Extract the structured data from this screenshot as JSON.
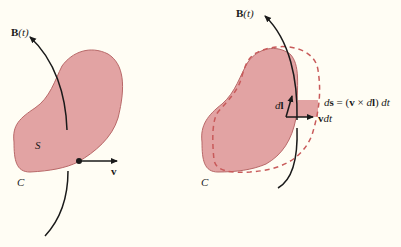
{
  "colors": {
    "background": "#fffdf4",
    "surface_fill": "#e2a3a3",
    "surface_stroke": "#b86868",
    "dashed_curve": "#c85a5a",
    "ink": "#1a1a1a"
  },
  "left_figure": {
    "field_label_bold": "B",
    "field_label_arg": "(t)",
    "surface_label": "S",
    "curve_label": "C",
    "velocity_label": "v"
  },
  "right_figure": {
    "field_label_bold": "B",
    "field_label_arg": "(t)",
    "curve_label": "C",
    "line_element_d": "d",
    "line_element_bold": "l",
    "displacement_v": "v",
    "displacement_dt": "dt",
    "area_element_equation": {
      "d": "d",
      "s": "s",
      "eq": " = (",
      "v": "v",
      "cross": " × ",
      "d2": "d",
      "l": "l",
      "close": ") ",
      "dt": "dt"
    }
  }
}
